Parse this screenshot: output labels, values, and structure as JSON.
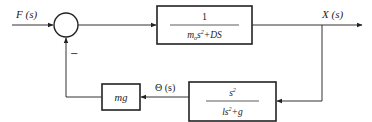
{
  "diagram": {
    "type": "control-system block diagram",
    "input": {
      "label": "F (s)"
    },
    "summing_junction": {
      "input_sign": "+",
      "feedback_sign": "−"
    },
    "forward_block": {
      "numerator": "1",
      "denominator_parts": [
        "m",
        "o",
        "s",
        "2",
        "+DS"
      ]
    },
    "output": {
      "label": "X (s)"
    },
    "feedback_block_1": {
      "numerator_base": "s",
      "numerator_exp": "2",
      "denominator_parts": [
        "ls",
        "2",
        "+g"
      ]
    },
    "intermediate_signal": {
      "label": "Θ (s)"
    },
    "feedback_block_2": {
      "label": "mg"
    }
  }
}
